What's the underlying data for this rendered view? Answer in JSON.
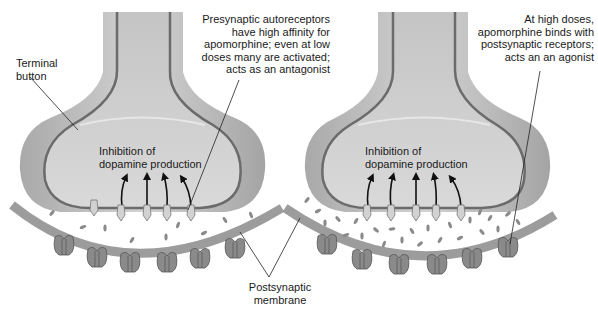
{
  "figure": {
    "panels": [
      {
        "id": "low-dose",
        "inner_label": "Inhibition of\ndopamine production",
        "annotation": "Presynaptic autoreceptors\nhave high affinity for\napomorphine; even at low\ndoses many are activated;\nacts as an antagonist",
        "activated_autoreceptors": 4,
        "total_autoreceptors": 5
      },
      {
        "id": "high-dose",
        "inner_label": "Inhibition of\ndopamine production",
        "annotation": "At high doses,\napomorphine binds with\npostsynaptic receptors;\nacts an an agonist",
        "activated_autoreceptors": 5,
        "total_autoreceptors": 5
      }
    ],
    "labels": {
      "terminal_button": "Terminal\nbutton",
      "postsynaptic_membrane": "Postsynaptic\nmembrane"
    },
    "colors": {
      "terminal_fill": "#bdbdbd",
      "terminal_inner": "#cfcfcf",
      "membrane_line": "#6e6e6e",
      "postsynaptic": "#9a9a9a",
      "receptor": "#7d7d7d",
      "drug": "#8c8c8c",
      "text": "#1a1a1a"
    }
  }
}
